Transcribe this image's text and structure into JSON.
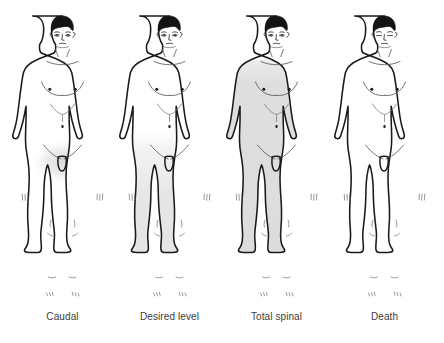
{
  "panel": {
    "title": "Levels of spinal anaesthesia block",
    "background_color": "#ffffff",
    "outline_color": "#1a1a1a",
    "shade_color": "#dcdcdc",
    "caption_color": "#3b3b3b"
  },
  "figures": [
    {
      "id": "figure-caudal",
      "caption": "Caudal",
      "shading": "perineal-groin-only",
      "shade_top_y": 142,
      "shade_opacity": 0.55,
      "eyes": "open",
      "description": "Anterior male figure, unshaded, light blush of shading limited to the groin and perineum"
    },
    {
      "id": "figure-desired-level",
      "caption": "Desired level",
      "shading": "below-umbilicus",
      "shade_top_y": 122,
      "shade_opacity": 0.8,
      "eyes": "open",
      "description": "Anterior male figure shaded from just below the umbilicus downward through both legs"
    },
    {
      "id": "figure-total-spinal",
      "caption": "Total spinal",
      "shading": "whole-body-below-head",
      "shade_top_y": 58,
      "shade_opacity": 1,
      "eyes": "open",
      "description": "Anterior male figure shaded over the entire body below the head, including arms and legs"
    },
    {
      "id": "figure-death",
      "caption": "Death",
      "shading": "none",
      "shade_top_y": 0,
      "shade_opacity": 0,
      "eyes": "closed",
      "description": "Anterior male figure, unshaded, eyes closed"
    }
  ]
}
